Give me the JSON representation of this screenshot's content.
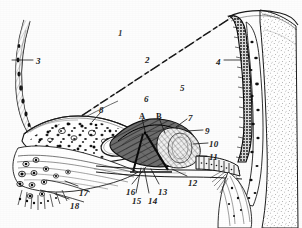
{
  "figure": {
    "kind": "anatomical-cross-section-illustration",
    "style": "engraved line-drawing, black ink on white paper, scanned",
    "width": 302,
    "height": 228,
    "background_color": "#fdfdfd",
    "ink_color": "#1b1b1b"
  },
  "labels": [
    {
      "id": "label-1",
      "text": "1",
      "x": 118,
      "y": 29,
      "style": "faint",
      "leader": null
    },
    {
      "id": "label-2",
      "text": "2",
      "x": 145,
      "y": 56,
      "style": "normal",
      "leader": null
    },
    {
      "id": "label-3",
      "text": "3",
      "x": 36,
      "y": 57,
      "style": "normal",
      "leader": {
        "x1": 33,
        "y1": 60,
        "x2": 12,
        "y2": 60
      }
    },
    {
      "id": "label-4",
      "text": "4",
      "x": 216,
      "y": 58,
      "style": "normal",
      "leader": {
        "x1": 224,
        "y1": 60,
        "x2": 241,
        "y2": 60
      }
    },
    {
      "id": "label-5",
      "text": "5",
      "x": 180,
      "y": 84,
      "style": "normal",
      "leader": null
    },
    {
      "id": "label-6",
      "text": "6",
      "x": 144,
      "y": 95,
      "style": "normal",
      "leader": null
    },
    {
      "id": "label-7",
      "text": "7",
      "x": 188,
      "y": 114,
      "style": "normal",
      "leader": {
        "x1": 187,
        "y1": 119,
        "x2": 176,
        "y2": 127
      }
    },
    {
      "id": "label-8",
      "text": "8",
      "x": 99,
      "y": 106,
      "style": "normal",
      "leader": {
        "x1": 101,
        "y1": 112,
        "x2": 92,
        "y2": 122
      }
    },
    {
      "id": "label-9",
      "text": "9",
      "x": 205,
      "y": 127,
      "style": "normal",
      "leader": {
        "x1": 203,
        "y1": 130,
        "x2": 186,
        "y2": 131
      }
    },
    {
      "id": "label-10",
      "text": "10",
      "x": 209,
      "y": 140,
      "style": "normal",
      "leader": {
        "x1": 208,
        "y1": 143,
        "x2": 193,
        "y2": 144
      }
    },
    {
      "id": "label-11",
      "text": "11",
      "x": 209,
      "y": 153,
      "style": "normal",
      "leader": {
        "x1": 207,
        "y1": 156,
        "x2": 197,
        "y2": 156
      }
    },
    {
      "id": "label-12",
      "text": "12",
      "x": 188,
      "y": 179,
      "style": "normal",
      "leader": {
        "x1": 187,
        "y1": 176,
        "x2": 172,
        "y2": 169
      }
    },
    {
      "id": "label-13",
      "text": "13",
      "x": 158,
      "y": 188,
      "style": "normal",
      "leader": {
        "x1": 159,
        "y1": 184,
        "x2": 151,
        "y2": 169
      }
    },
    {
      "id": "label-14",
      "text": "14",
      "x": 148,
      "y": 197,
      "style": "normal",
      "leader": {
        "x1": 149,
        "y1": 193,
        "x2": 144,
        "y2": 168
      }
    },
    {
      "id": "label-15",
      "text": "15",
      "x": 132,
      "y": 197,
      "style": "normal",
      "leader": {
        "x1": 136,
        "y1": 193,
        "x2": 141,
        "y2": 168
      }
    },
    {
      "id": "label-16",
      "text": "16",
      "x": 126,
      "y": 188,
      "style": "normal",
      "leader": {
        "x1": 132,
        "y1": 184,
        "x2": 146,
        "y2": 167
      }
    },
    {
      "id": "label-17",
      "text": "17",
      "x": 79,
      "y": 189,
      "style": "normal",
      "leader": {
        "x1": 78,
        "y1": 186,
        "x2": 65,
        "y2": 181
      }
    },
    {
      "id": "label-18",
      "text": "18",
      "x": 70,
      "y": 202,
      "style": "normal",
      "leader": {
        "x1": 69,
        "y1": 199,
        "x2": 55,
        "y2": 194
      }
    },
    {
      "id": "label-A",
      "text": "A",
      "x": 139,
      "y": 112,
      "style": "letter",
      "leader": {
        "x1": 142,
        "y1": 118,
        "x2": 145,
        "y2": 131
      }
    },
    {
      "id": "label-B",
      "text": "B",
      "x": 156,
      "y": 112,
      "style": "letter",
      "leader": {
        "x1": 159,
        "y1": 118,
        "x2": 165,
        "y2": 133
      }
    }
  ]
}
